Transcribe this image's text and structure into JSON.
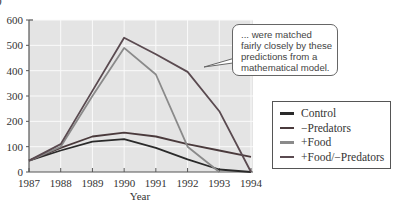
{
  "panel_label": ")",
  "callout": {
    "lines": [
      "... were matched",
      "fairly closely by these",
      "predictions from a",
      "mathematical model."
    ]
  },
  "legend": {
    "items": [
      {
        "label": "Control",
        "color": "#2a2a2a"
      },
      {
        "label": "−Predators",
        "color": "#4a3a3c"
      },
      {
        "label": "+Food",
        "color": "#8a8a8a"
      },
      {
        "label": "+Food/−Predators",
        "color": "#5a4a50"
      }
    ]
  },
  "chart_data": {
    "type": "line",
    "title": "",
    "xlabel": "Year",
    "ylabel": "",
    "x": [
      1987,
      1988,
      1989,
      1990,
      1991,
      1992,
      1993,
      1994
    ],
    "xticks": [
      "1987",
      "1988",
      "1989",
      "1990",
      "1991",
      "1992",
      "1993",
      "1994"
    ],
    "yticks": [
      0,
      100,
      200,
      300,
      400,
      500,
      600
    ],
    "ylim": [
      0,
      600
    ],
    "grid": true,
    "legend_position": "right",
    "series": [
      {
        "name": "Control",
        "color": "#2a2a2a",
        "values": [
          45,
          85,
          120,
          130,
          95,
          50,
          10,
          0
        ]
      },
      {
        "name": "−Predators",
        "color": "#4a3a3c",
        "values": [
          45,
          95,
          140,
          155,
          140,
          110,
          85,
          60
        ]
      },
      {
        "name": "+Food",
        "color": "#8a8a8a",
        "values": [
          45,
          100,
          300,
          490,
          385,
          100,
          0,
          null
        ]
      },
      {
        "name": "+Food/−Predators",
        "color": "#5a4a50",
        "values": [
          45,
          110,
          320,
          530,
          465,
          395,
          240,
          0
        ]
      }
    ],
    "annotations": [
      "... were matched fairly closely by these predictions from a mathematical model."
    ]
  }
}
